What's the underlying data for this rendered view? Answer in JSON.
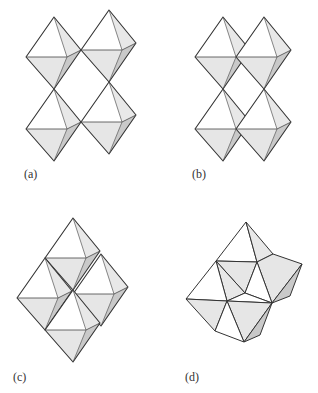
{
  "figure": {
    "panels": [
      {
        "id": "a",
        "label": "(a)",
        "description": "Corner-sharing octahedra"
      },
      {
        "id": "b",
        "label": "(b)",
        "description": "Corner-sharing octahedra, offset"
      },
      {
        "id": "c",
        "label": "(c)",
        "description": "Edge-sharing octahedra"
      },
      {
        "id": "d",
        "label": "(d)",
        "description": "Face-sharing octahedra"
      }
    ],
    "colors": {
      "stroke": "#333333",
      "face_white": "#ffffff",
      "face_light": "#e6e6e6",
      "face_dark": "#c8c8c8"
    }
  }
}
